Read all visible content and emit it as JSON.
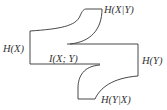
{
  "diagram": {
    "type": "information-diagram",
    "labels": {
      "hx": "H(X)",
      "hy": "H(Y)",
      "hx_given_y": "H(X|Y)",
      "hy_given_x": "H(Y|X)",
      "mutual_info": "I(X; Y)"
    },
    "colors": {
      "stroke": "#333333",
      "background": "#ffffff"
    }
  }
}
